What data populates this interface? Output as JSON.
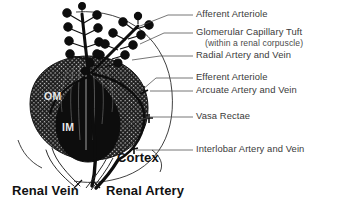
{
  "figure": {
    "background_color": "#ffffff",
    "ink_color": "#111111",
    "label_color": "#3a3a3a"
  },
  "callouts": [
    {
      "id": "afferent-arteriole",
      "label": "Afferent Arteriole",
      "x": 196,
      "y": 11
    },
    {
      "id": "glomerular-capillary-tuft",
      "label": "Glomerular Capillary Tuft",
      "x": 196,
      "y": 29
    },
    {
      "id": "glomerular-capillary-tuft-sub",
      "label": "(within a renal corpuscle)",
      "x": 205,
      "y": 40
    },
    {
      "id": "radial-artery-and-vein",
      "label": "Radial Artery and Vein",
      "x": 196,
      "y": 52
    },
    {
      "id": "efferent-arteriole",
      "label": "Efferent Arteriole",
      "x": 196,
      "y": 74
    },
    {
      "id": "arcuate-artery-and-vein",
      "label": "Arcuate Artery and Vein",
      "x": 196,
      "y": 87
    },
    {
      "id": "vasa-rectae",
      "label": "Vasa Rectae",
      "x": 196,
      "y": 113
    },
    {
      "id": "interlobar-artery-and-vein",
      "label": "Interlobar Artery and Vein",
      "x": 196,
      "y": 146
    }
  ],
  "annotations": {
    "cortex": {
      "label": "Cortex",
      "x": 117,
      "y": 157,
      "font_size": "13px"
    },
    "renal_vein": {
      "label": "Renal Vein",
      "x": 12,
      "y": 190,
      "font_size": "13px"
    },
    "renal_artery": {
      "label": "Renal Artery",
      "x": 106,
      "y": 190,
      "font_size": "13px"
    },
    "outer_medulla": {
      "label": "OM",
      "x": 44,
      "y": 97
    },
    "inner_medulla": {
      "label": "IM",
      "x": 62,
      "y": 128
    }
  },
  "structures": {
    "glomeruli_count_left_column": 9,
    "glomeruli_count_right_column": 12,
    "medulla_regions": [
      "OM",
      "IM"
    ],
    "vessels": [
      "Renal Artery",
      "Renal Vein",
      "Interlobar Artery and Vein",
      "Arcuate Artery and Vein",
      "Radial Artery and Vein",
      "Afferent Arteriole",
      "Efferent Arteriole",
      "Vasa Rectae"
    ]
  }
}
